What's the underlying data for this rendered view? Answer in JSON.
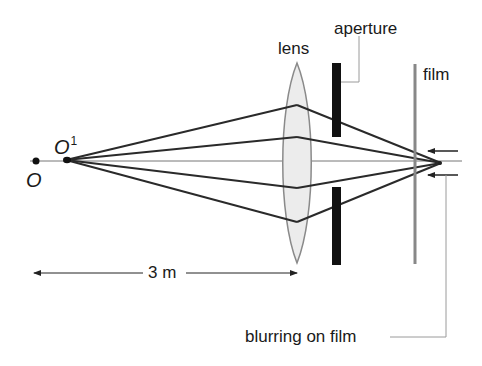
{
  "figure": {
    "type": "optics-ray-diagram"
  },
  "labels": {
    "object_point": "O",
    "image_point_main": "O",
    "image_point_sup": "1",
    "lens": "lens",
    "aperture": "aperture",
    "film": "film",
    "distance": "3 m",
    "blurring": "blurring on film"
  },
  "colors": {
    "ray": "#2a2a2a",
    "axis": "#777777",
    "lens_fill": "#ececec",
    "lens_edge": "#8a8a8a",
    "aperture": "#111111",
    "film": "#888888",
    "leader": "#9a9a9a",
    "text": "#1a1a1a"
  }
}
